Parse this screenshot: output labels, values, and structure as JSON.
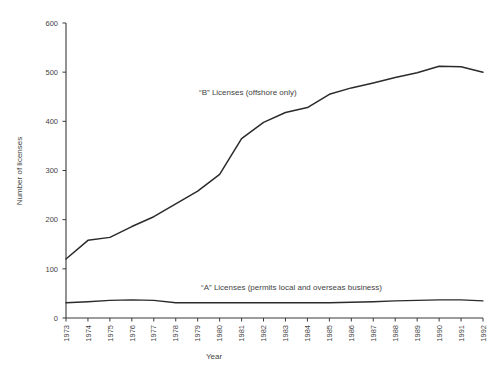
{
  "chart_data": {
    "type": "line",
    "title": "",
    "xlabel": "Year",
    "ylabel": "Number of licenses",
    "xlim": [
      1973,
      1992
    ],
    "ylim": [
      0,
      600
    ],
    "yticks": [
      0,
      100,
      200,
      300,
      400,
      500,
      600
    ],
    "ytick_labels": [
      "0",
      "100",
      "200",
      "300",
      "400",
      "500",
      "600"
    ],
    "grid": false,
    "legend_position": "inline-annotations",
    "categories": [
      "1973",
      "1974",
      "1975",
      "1976",
      "1977",
      "1978",
      "1979",
      "1980",
      "1981",
      "1982",
      "1983",
      "1984",
      "1985",
      "1986",
      "1987",
      "1988",
      "1989",
      "1990",
      "1991",
      "1992"
    ],
    "series": [
      {
        "name": "“B” Licenses (offshore only)",
        "annotation": "“B” Licenses (offshore only)",
        "color": "#2b2b2b",
        "values": [
          120,
          158,
          164,
          186,
          206,
          232,
          258,
          292,
          365,
          398,
          418,
          428,
          455,
          468,
          478,
          489,
          499,
          512,
          511,
          500
        ]
      },
      {
        "name": "“A” Licenses (permits local and overseas business)",
        "annotation": "“A” Licenses (permits local and overseas business)",
        "color": "#2b2b2b",
        "values": [
          31,
          33,
          36,
          37,
          36,
          31,
          31,
          31,
          31,
          31,
          31,
          31,
          31,
          32,
          33,
          35,
          36,
          37,
          37,
          35
        ]
      }
    ],
    "annotations": [
      {
        "id": "series-b-label",
        "text": "“B” Licenses (offshore only)",
        "x_px": 199,
        "y_px": 95
      },
      {
        "id": "series-a-label",
        "text": "“A” Licenses (permits local and overseas business)",
        "x_px": 201,
        "y_px": 290
      }
    ]
  },
  "axes": {
    "y_title": "Number of licenses",
    "x_title": "Year"
  }
}
